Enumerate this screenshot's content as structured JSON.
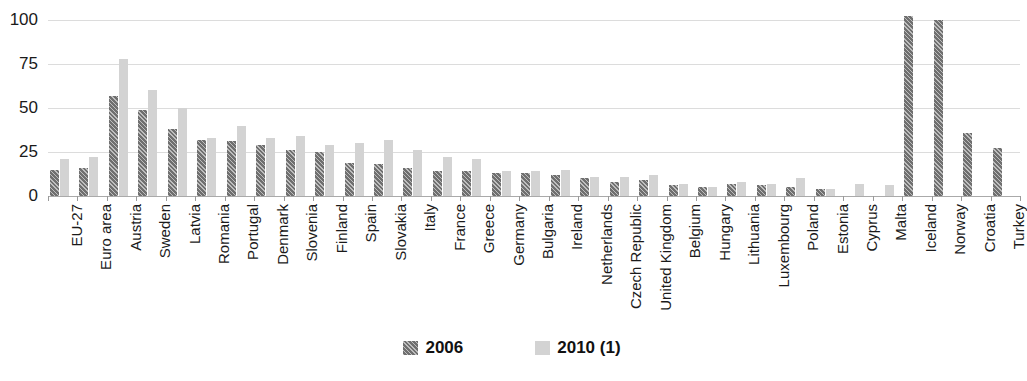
{
  "chart_data": {
    "type": "bar",
    "title": "",
    "subtitle": "",
    "xlabel": "",
    "ylabel": "",
    "ylim": [
      0,
      100
    ],
    "yticks": [
      0,
      25,
      50,
      75,
      100
    ],
    "ytick_labels": [
      "0",
      "25",
      "50",
      "75",
      "100"
    ],
    "grid": true,
    "legend_position": "bottom",
    "categories": [
      "EU-27",
      "Euro area",
      "Austria",
      "Sweden",
      "Latvia",
      "Romania",
      "Portugal",
      "Denmark",
      "Slovenia",
      "Finland",
      "Spain",
      "Slovakia",
      "Italy",
      "France",
      "Greece",
      "Germany",
      "Bulgaria",
      "Ireland",
      "Netherlands",
      "Czech Republic",
      "United Kingdom",
      "Belgium",
      "Hungary",
      "Lithuania",
      "Luxembourg",
      "Poland",
      "Estonia",
      "Cyprus",
      "Malta",
      "Iceland",
      "Norway",
      "Croatia",
      "Turkey"
    ],
    "series": [
      {
        "name": "2006",
        "color": "#6f6f6f",
        "pattern": "diagonal-hatch",
        "values": [
          15,
          16,
          57,
          49,
          38,
          32,
          31,
          29,
          26,
          25,
          19,
          18,
          16,
          14,
          14,
          13,
          13,
          12,
          10,
          8,
          9,
          6,
          5,
          7,
          6,
          5,
          4,
          null,
          null,
          102,
          100,
          36,
          27
        ]
      },
      {
        "name": "2010 (1)",
        "color": "#d3d3d3",
        "pattern": "solid",
        "values": [
          21,
          22,
          78,
          60,
          50,
          33,
          40,
          33,
          34,
          29,
          30,
          32,
          26,
          22,
          21,
          14,
          14,
          15,
          11,
          11,
          12,
          7,
          5,
          8,
          7,
          10,
          4,
          7,
          6,
          null,
          null,
          null,
          null
        ]
      }
    ]
  },
  "legend": {
    "items": [
      {
        "label": "2006",
        "swatch": "hatched-dark-swatch"
      },
      {
        "label": "2010 (1)",
        "swatch": "solid-light-swatch"
      }
    ]
  },
  "colors": {
    "series_2006": "#6f6f6f",
    "series_2010": "#d3d3d3",
    "gridline": "#dcdcdc",
    "axis": "#aaaaaa",
    "text": "#1a1a1a",
    "background": "#ffffff"
  }
}
